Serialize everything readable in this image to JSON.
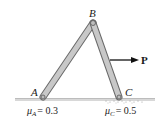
{
  "diagram": {
    "type": "statics-two-member-frame",
    "points": {
      "A": {
        "label": "A",
        "x": 43,
        "y": 97
      },
      "B": {
        "label": "B",
        "x": 93,
        "y": 23
      },
      "C": {
        "label": "C",
        "x": 119,
        "y": 97
      }
    },
    "members": [
      {
        "name": "AB",
        "from": "A",
        "to": "B"
      },
      {
        "name": "BC",
        "from": "B",
        "to": "C"
      }
    ],
    "force": {
      "label": "P",
      "direction": "right"
    },
    "friction": {
      "A": {
        "symbol": "μ",
        "sub": "A",
        "value": "= 0.3"
      },
      "C": {
        "symbol": "μ",
        "sub": "C",
        "value": "= 0.5"
      }
    },
    "colors": {
      "member_fill": "#c8c8c8",
      "member_stroke": "#6a6a6a",
      "ground": "#8a8a8a",
      "text": "#1a1a1a"
    }
  }
}
